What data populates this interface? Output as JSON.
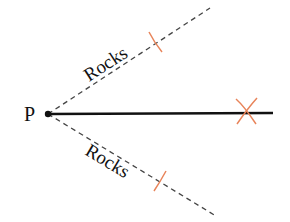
{
  "diagram": {
    "point_label": "P",
    "upper_label": "Rocks",
    "lower_label": "Rocks",
    "colors": {
      "line": "#111111",
      "dashed": "#444444",
      "construction": "#e8845a"
    }
  }
}
